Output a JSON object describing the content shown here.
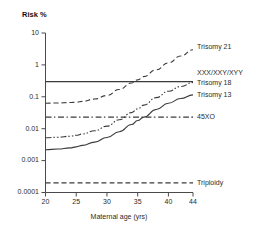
{
  "chart_data": {
    "type": "line",
    "title": "Risk %",
    "xlabel": "Maternal age (yrs)",
    "ylabel": "Risk %",
    "yscale": "log",
    "ylim": [
      0.0001,
      10
    ],
    "xlim": [
      20,
      44
    ],
    "grid": false,
    "legend_position": "right",
    "ytick_labels": [
      "10",
      "1",
      "0.1",
      "0.01",
      "0.001",
      "0.0001"
    ],
    "ytick_values": [
      10,
      1,
      0.1,
      0.01,
      0.001,
      0.0001
    ],
    "xtick_labels": [
      "20",
      "25",
      "30",
      "35",
      "40",
      "44"
    ],
    "xtick_values": [
      20,
      25,
      30,
      35,
      40,
      44
    ],
    "x": [
      20,
      22,
      24,
      25,
      26,
      28,
      30,
      32,
      34,
      35,
      36,
      38,
      40,
      42,
      44
    ],
    "series": [
      {
        "name": "Trisomy 21",
        "style": "dashed",
        "label_value": 3.0,
        "values": [
          0.063,
          0.064,
          0.066,
          0.068,
          0.072,
          0.085,
          0.11,
          0.17,
          0.27,
          0.34,
          0.43,
          0.7,
          1.15,
          1.9,
          3.0
        ]
      },
      {
        "name": "XXX/XXY/XYY",
        "style": "solid",
        "label_value": 0.3,
        "values": [
          0.3,
          0.3,
          0.3,
          0.3,
          0.3,
          0.3,
          0.3,
          0.3,
          0.3,
          0.3,
          0.3,
          0.3,
          0.3,
          0.3,
          0.3
        ]
      },
      {
        "name": "Trisomy 18",
        "style": "dash-dot-dot",
        "label_value": 0.28,
        "values": [
          0.0052,
          0.0054,
          0.0058,
          0.0062,
          0.0068,
          0.0086,
          0.012,
          0.019,
          0.032,
          0.042,
          0.055,
          0.094,
          0.15,
          0.21,
          0.28
        ]
      },
      {
        "name": "Trisomy 13",
        "style": "solid",
        "label_value": 0.115,
        "values": [
          0.0022,
          0.0023,
          0.0025,
          0.0027,
          0.003,
          0.0038,
          0.0053,
          0.008,
          0.0135,
          0.018,
          0.023,
          0.04,
          0.063,
          0.088,
          0.115
        ]
      },
      {
        "name": "45XO",
        "style": "dash-dot",
        "label_value": 0.023,
        "values": [
          0.023,
          0.023,
          0.023,
          0.023,
          0.023,
          0.023,
          0.023,
          0.023,
          0.023,
          0.023,
          0.023,
          0.023,
          0.023,
          0.023,
          0.023
        ]
      },
      {
        "name": "Triploidy",
        "style": "dashed",
        "label_value": 0.0002,
        "values": [
          0.0002,
          0.0002,
          0.0002,
          0.0002,
          0.0002,
          0.0002,
          0.0002,
          0.0002,
          0.0002,
          0.0002,
          0.0002,
          0.0002,
          0.0002,
          0.0002,
          0.0002
        ]
      }
    ],
    "legend_entries": [
      {
        "label": "Trisomy 21",
        "y_value": 3.6
      },
      {
        "label": "XXX/XXY/XYY",
        "y_value": 0.55
      },
      {
        "label": "Trisomy 18",
        "y_value": 0.26
      },
      {
        "label": "Trisomy 13",
        "y_value": 0.115
      },
      {
        "label": "45XO",
        "y_value": 0.023
      },
      {
        "label": "Triploidy",
        "y_value": 0.0002
      }
    ]
  }
}
